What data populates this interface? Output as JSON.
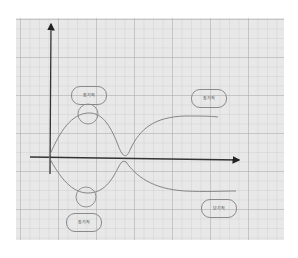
{
  "diagram": {
    "type": "curve-crossing-diagram",
    "background": {
      "style": "graph-paper grid",
      "panel_color": "#e8e8e8",
      "grid_color": "#aaaaaa"
    },
    "axes": {
      "x_axis": {
        "direction": "right",
        "arrow": true,
        "label": ""
      },
      "y_axis": {
        "direction": "up",
        "arrow": true,
        "label": ""
      },
      "color": "#333333"
    },
    "curves": [
      {
        "name": "rising-curve",
        "description": "starts at origin, rises to a peak, falls back to x-axis crossing, then rises to an upper plateau",
        "color": "#777777"
      },
      {
        "name": "falling-curve",
        "description": "starts at origin, dips to a trough, rises back to x-axis crossing, then falls to a lower plateau",
        "color": "#777777"
      }
    ],
    "markers": [
      {
        "name": "peak-circle",
        "position": "top of first hump"
      },
      {
        "name": "trough-circle",
        "position": "bottom of first dip"
      }
    ],
    "labels": [
      {
        "id": "label-top-left",
        "text": "장기적"
      },
      {
        "id": "label-top-right",
        "text": "장기적"
      },
      {
        "id": "label-bottom-left",
        "text": "장기적"
      },
      {
        "id": "label-bottom-right",
        "text": "단기적"
      }
    ]
  }
}
